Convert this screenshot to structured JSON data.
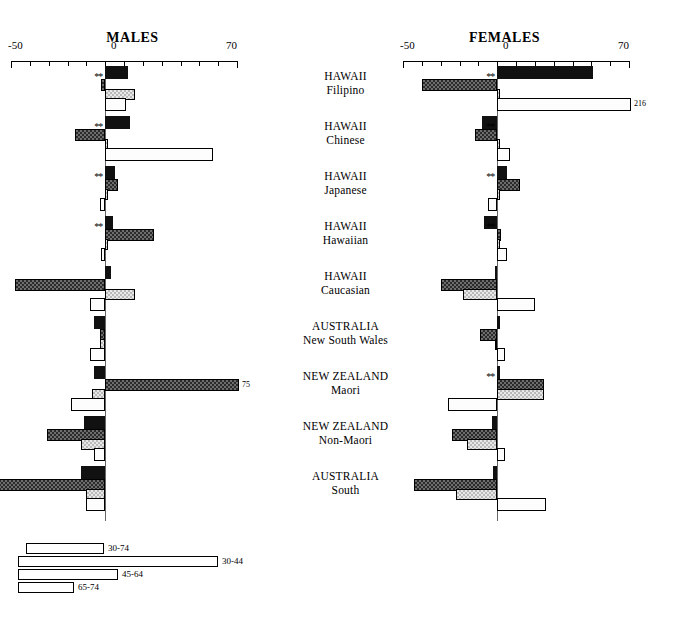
{
  "chart_data": {
    "type": "bar",
    "orientation": "horizontal",
    "panels": [
      {
        "name": "males",
        "label": "MALES"
      },
      {
        "name": "females",
        "label": "FEMALES"
      }
    ],
    "axis": {
      "min": -50,
      "max": 70,
      "tick_labels": [
        "-50",
        "0",
        "70"
      ],
      "tick_values": [
        -50,
        0,
        70
      ],
      "tick_step": 10,
      "grid": false
    },
    "series": [
      {
        "name": "30-74",
        "key": "b3074"
      },
      {
        "name": "30-44",
        "key": "b3044"
      },
      {
        "name": "45-64",
        "key": "b4564"
      },
      {
        "name": "65-74",
        "key": "b6574"
      }
    ],
    "categories": [
      {
        "line1": "HAWAII",
        "line2": "Filipino"
      },
      {
        "line1": "HAWAII",
        "line2": "Chinese"
      },
      {
        "line1": "HAWAII",
        "line2": "Japanese"
      },
      {
        "line1": "HAWAII",
        "line2": "Hawaiian"
      },
      {
        "line1": "HAWAII",
        "line2": "Caucasian"
      },
      {
        "line1": "AUSTRALIA",
        "line2": "New South Wales"
      },
      {
        "line1": "NEW ZEALAND",
        "line2": "Maori"
      },
      {
        "line1": "NEW ZEALAND",
        "line2": "Non-Maori"
      },
      {
        "line1": "AUSTRALIA",
        "line2": "South"
      }
    ],
    "males": {
      "b3074": [
        12,
        13,
        5,
        4,
        3,
        -6,
        -6,
        -11,
        -13
      ],
      "b3044": [
        -2,
        -16,
        7,
        26,
        -48,
        -3,
        75,
        -31,
        -77
      ],
      "b4564": [
        16,
        0,
        0,
        0,
        16,
        -3,
        -7,
        -13,
        -10
      ],
      "b6574": [
        11,
        57,
        -3,
        -2,
        -8,
        -8,
        -18,
        -6,
        -10
      ],
      "significance": {
        "b3044": [
          true,
          true,
          true,
          true,
          false,
          false,
          false,
          false,
          false
        ]
      },
      "value_tags": [
        {
          "group": 6,
          "series": "b3044",
          "text": "75"
        },
        {
          "group": 8,
          "series": "b3044",
          "text": "77"
        }
      ]
    },
    "females": {
      "b3074": [
        51,
        -8,
        5,
        -7,
        -1,
        0,
        0,
        -3,
        -2
      ],
      "b3044": [
        -40,
        -12,
        12,
        2,
        -30,
        -9,
        25,
        -24,
        -44
      ],
      "b4564": [
        0,
        0,
        0,
        0,
        -18,
        -1,
        25,
        -16,
        -22
      ],
      "b6574": [
        216,
        7,
        -5,
        5,
        20,
        4,
        -26,
        4,
        26
      ],
      "significance": {
        "b3044": [
          true,
          true,
          true,
          true,
          false,
          false,
          true,
          false,
          false
        ]
      },
      "value_tags": [
        {
          "group": 0,
          "series": "b6574",
          "text": "216"
        }
      ]
    },
    "legend": {
      "position": "bottom-left",
      "items": [
        {
          "label": "30-74"
        },
        {
          "label": "30-44"
        },
        {
          "label": "45-64"
        },
        {
          "label": "65-74"
        }
      ]
    },
    "significance_marker": "**"
  }
}
